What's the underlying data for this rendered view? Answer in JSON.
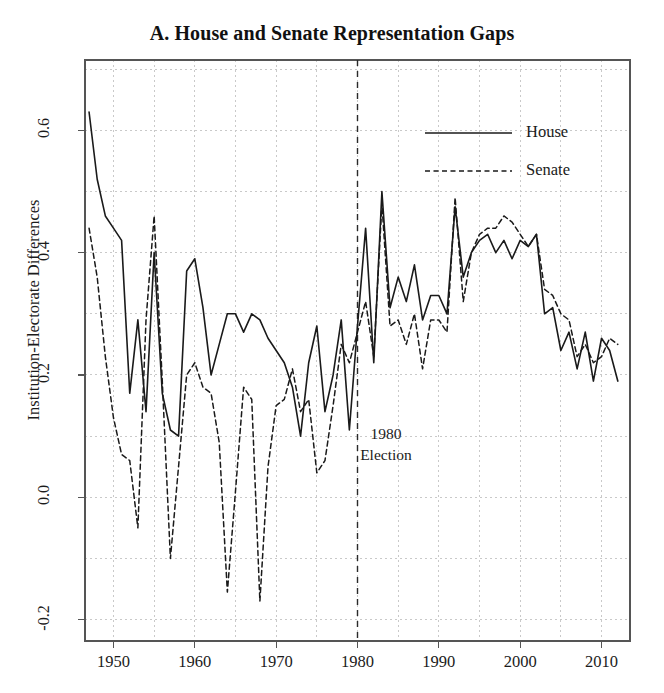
{
  "chart_data": {
    "type": "line",
    "title": "A. House and Senate Representation Gaps",
    "xlabel": "",
    "ylabel": "Institution-Electorate Differences",
    "xlim": [
      1946.5,
      2013.5
    ],
    "ylim": [
      -0.235,
      0.715
    ],
    "grid": true,
    "grid_style": "dotted light gray, major at ticks and minor midway",
    "legend_position": "top right inside plot",
    "xticks": [
      1950,
      1960,
      1970,
      1980,
      1990,
      2000,
      2010
    ],
    "xtick_labels": [
      "1950",
      "1960",
      "1970",
      "1980",
      "1990",
      "2000",
      "2010"
    ],
    "yticks": [
      -0.2,
      0.0,
      0.2,
      0.4,
      0.6
    ],
    "ytick_labels": [
      "-0.2",
      "0.0",
      "0.2",
      "0.4",
      "0.6"
    ],
    "annotations": [
      {
        "name": "election-marker",
        "type": "vline",
        "x": 1980,
        "style": "dashed",
        "label_lines": [
          "1980",
          "Election"
        ],
        "label_x": 1983.5,
        "label_y": 0.085
      }
    ],
    "series": [
      {
        "name": "House",
        "style": "solid",
        "color": "#1a1a1a",
        "x": [
          1947,
          1948,
          1949,
          1950,
          1951,
          1952,
          1953,
          1954,
          1955,
          1956,
          1957,
          1958,
          1959,
          1960,
          1961,
          1962,
          1963,
          1964,
          1965,
          1966,
          1967,
          1968,
          1969,
          1970,
          1971,
          1972,
          1973,
          1974,
          1975,
          1976,
          1977,
          1978,
          1979,
          1980,
          1981,
          1982,
          1983,
          1984,
          1985,
          1986,
          1987,
          1988,
          1989,
          1990,
          1991,
          1992,
          1993,
          1994,
          1995,
          1996,
          1997,
          1998,
          1999,
          2000,
          2001,
          2002,
          2003,
          2004,
          2005,
          2006,
          2007,
          2008,
          2009,
          2010,
          2011,
          2012
        ],
        "y": [
          0.63,
          0.52,
          0.46,
          0.44,
          0.42,
          0.17,
          0.29,
          0.14,
          0.4,
          0.17,
          0.11,
          0.1,
          0.37,
          0.39,
          0.31,
          0.2,
          0.25,
          0.3,
          0.3,
          0.27,
          0.3,
          0.29,
          0.26,
          0.24,
          0.22,
          0.18,
          0.1,
          0.22,
          0.28,
          0.14,
          0.2,
          0.29,
          0.11,
          0.28,
          0.44,
          0.22,
          0.5,
          0.31,
          0.36,
          0.32,
          0.38,
          0.29,
          0.33,
          0.33,
          0.3,
          0.475,
          0.36,
          0.4,
          0.42,
          0.43,
          0.4,
          0.42,
          0.39,
          0.42,
          0.41,
          0.43,
          0.3,
          0.31,
          0.24,
          0.27,
          0.21,
          0.27,
          0.19,
          0.26,
          0.24,
          0.19
        ]
      },
      {
        "name": "Senate",
        "style": "dashed",
        "color": "#1a1a1a",
        "x": [
          1947,
          1948,
          1949,
          1950,
          1951,
          1952,
          1953,
          1954,
          1955,
          1956,
          1957,
          1958,
          1959,
          1960,
          1961,
          1962,
          1963,
          1964,
          1965,
          1966,
          1967,
          1968,
          1969,
          1970,
          1971,
          1972,
          1973,
          1974,
          1975,
          1976,
          1977,
          1978,
          1979,
          1980,
          1981,
          1982,
          1983,
          1984,
          1985,
          1986,
          1987,
          1988,
          1989,
          1990,
          1991,
          1992,
          1993,
          1994,
          1995,
          1996,
          1997,
          1998,
          1999,
          2000,
          2001,
          2002,
          2003,
          2004,
          2005,
          2006,
          2007,
          2008,
          2009,
          2010,
          2011,
          2012
        ],
        "y": [
          0.44,
          0.36,
          0.23,
          0.13,
          0.07,
          0.06,
          -0.05,
          0.29,
          0.46,
          0.19,
          -0.1,
          0.05,
          0.2,
          0.22,
          0.18,
          0.17,
          0.09,
          -0.155,
          0.01,
          0.18,
          0.16,
          -0.17,
          0.05,
          0.15,
          0.16,
          0.21,
          0.14,
          0.16,
          0.04,
          0.06,
          0.15,
          0.25,
          0.22,
          0.27,
          0.32,
          0.23,
          0.48,
          0.28,
          0.29,
          0.25,
          0.3,
          0.21,
          0.29,
          0.29,
          0.27,
          0.49,
          0.32,
          0.4,
          0.43,
          0.44,
          0.44,
          0.46,
          0.45,
          0.43,
          0.41,
          0.43,
          0.34,
          0.33,
          0.3,
          0.29,
          0.23,
          0.25,
          0.22,
          0.23,
          0.26,
          0.25
        ]
      }
    ]
  },
  "legend": {
    "items": [
      {
        "label": "House",
        "style": "solid"
      },
      {
        "label": "Senate",
        "style": "dashed"
      }
    ]
  },
  "colors": {
    "line": "#1a1a1a",
    "grid": "#c9c9c9",
    "frame": "#555555",
    "background": "#ffffff",
    "text": "#1b1b1b"
  }
}
